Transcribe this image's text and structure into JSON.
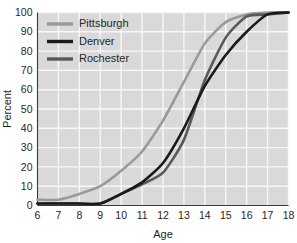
{
  "chart_data": {
    "type": "line",
    "title": "",
    "xlabel": "Age",
    "ylabel": "Percent",
    "xlim": [
      6,
      18
    ],
    "ylim": [
      0,
      100
    ],
    "grid": true,
    "legend_position": "top-left",
    "x": [
      6,
      7,
      8,
      9,
      10,
      11,
      12,
      13,
      14,
      15,
      16,
      17,
      18
    ],
    "xticks": [
      "6",
      "7",
      "8",
      "9",
      "10",
      "11",
      "12",
      "13",
      "14",
      "15",
      "16",
      "17",
      "18"
    ],
    "yticks": [
      "0",
      "10",
      "20",
      "30",
      "40",
      "50",
      "60",
      "70",
      "80",
      "90",
      "100"
    ],
    "series": [
      {
        "name": "Pittsburgh",
        "color": "#9a9a9a",
        "values": [
          3,
          3,
          6,
          10,
          18,
          28,
          44,
          64,
          84,
          95,
          99,
          100,
          100
        ]
      },
      {
        "name": "Denver",
        "color": "#1a1a1a",
        "values": [
          1,
          1,
          1,
          1,
          6,
          12,
          22,
          40,
          62,
          78,
          90,
          99,
          100
        ]
      },
      {
        "name": "Rochester",
        "color": "#595959",
        "values": [
          1,
          1,
          1,
          1,
          6,
          11,
          17,
          34,
          65,
          87,
          98,
          99,
          100
        ]
      }
    ]
  },
  "legend": {
    "entries": [
      {
        "label": "Pittsburgh"
      },
      {
        "label": "Denver"
      },
      {
        "label": "Rochester"
      }
    ]
  },
  "axes": {
    "y_title": "Percent",
    "x_title": "Age"
  },
  "colors": {
    "plot_background": "#d9d9d9",
    "gridline": "#f7f7f7",
    "axis": "#3a3a3a",
    "text": "#262626",
    "pittsburgh": "#9a9a9a",
    "denver": "#1a1a1a",
    "rochester": "#595959"
  }
}
